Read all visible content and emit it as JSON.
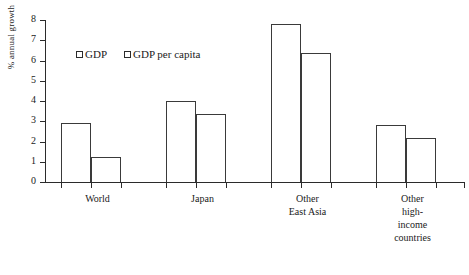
{
  "chart_data": {
    "type": "bar",
    "title": "",
    "xlabel": "",
    "ylabel": "% annual growth",
    "ylim": [
      0,
      8
    ],
    "yticks": [
      0,
      1,
      2,
      3,
      4,
      5,
      6,
      7,
      8
    ],
    "ytick_labels": [
      "0",
      "1",
      "2",
      "3",
      "4",
      "5",
      "6",
      "7",
      "8"
    ],
    "grid": false,
    "legend_position": "upper-left-inside",
    "categories": [
      "World",
      "Japan",
      "Other East Asia",
      "Other high-income countries"
    ],
    "category_label_lines": [
      [
        "World"
      ],
      [
        "Japan"
      ],
      [
        "Other",
        "East Asia"
      ],
      [
        "Other",
        "high-",
        "income",
        "countries"
      ]
    ],
    "series": [
      {
        "name": "GDP",
        "values": [
          2.9,
          4.0,
          7.8,
          2.8
        ]
      },
      {
        "name": "GDP per capita",
        "values": [
          1.23,
          3.35,
          6.35,
          2.15
        ]
      }
    ],
    "colors": {
      "bar_fill": "#ffffff",
      "bar_edge": "#3a3a3a",
      "axis": "#2b2b2b",
      "text": "#1a1a1a",
      "background": "#ffffff"
    }
  },
  "legend": {
    "items": [
      {
        "label": "GDP",
        "swatch": "empty-square-icon"
      },
      {
        "label": "GDP per capita",
        "swatch": "empty-square-icon"
      }
    ]
  },
  "axis": {
    "y_title": "% annual growth"
  }
}
